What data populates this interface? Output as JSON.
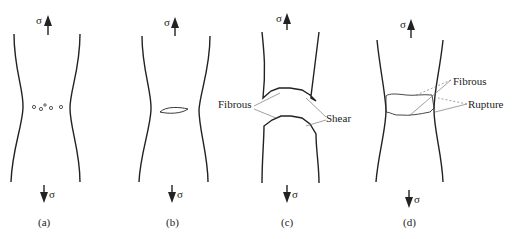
{
  "stress_symbol": "σ",
  "panels": [
    {
      "id": "a",
      "caption": "(a)",
      "description": "Void nucleation (small cavities)"
    },
    {
      "id": "b",
      "caption": "(b)",
      "description": "Void coalescence into a crack"
    },
    {
      "id": "c",
      "caption": "(c)",
      "description": "Cup-and-cone fracture",
      "labels": [
        "Fibrous",
        "Shear"
      ]
    },
    {
      "id": "d",
      "caption": "(d)",
      "description": "Final rupture",
      "labels": [
        "Fibrous",
        "Rupture"
      ]
    }
  ],
  "colors": {
    "line": "#222222",
    "leader": "#666666",
    "background": "#ffffff"
  }
}
